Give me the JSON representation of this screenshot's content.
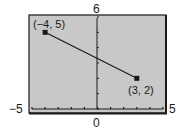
{
  "chart_data": {
    "type": "line",
    "title": "",
    "xlabel": "",
    "ylabel": "",
    "xlim": [
      -5,
      5
    ],
    "ylim": [
      0,
      6
    ],
    "grid": false,
    "x_tick_labels": {
      "min": "−5",
      "max": "5",
      "origin": "0"
    },
    "y_tick_labels": {
      "max": "6"
    },
    "x_ticks": [
      -5,
      -4,
      -3,
      -2,
      -1,
      0,
      1,
      2,
      3,
      4,
      5
    ],
    "y_ticks": [
      0,
      1,
      2,
      3,
      4,
      5,
      6
    ],
    "series": [
      {
        "name": "segment",
        "x": [
          -4,
          3
        ],
        "y": [
          5,
          2
        ]
      }
    ],
    "annotations": [
      {
        "text": "(−4, 5)",
        "x": -4,
        "y": 5
      },
      {
        "text": "(3, 2)",
        "x": 3,
        "y": 2
      }
    ]
  },
  "colors": {
    "screen_background": "#c8c8c8",
    "frame": "#1a1a1a",
    "line": "#1a1a1a"
  }
}
